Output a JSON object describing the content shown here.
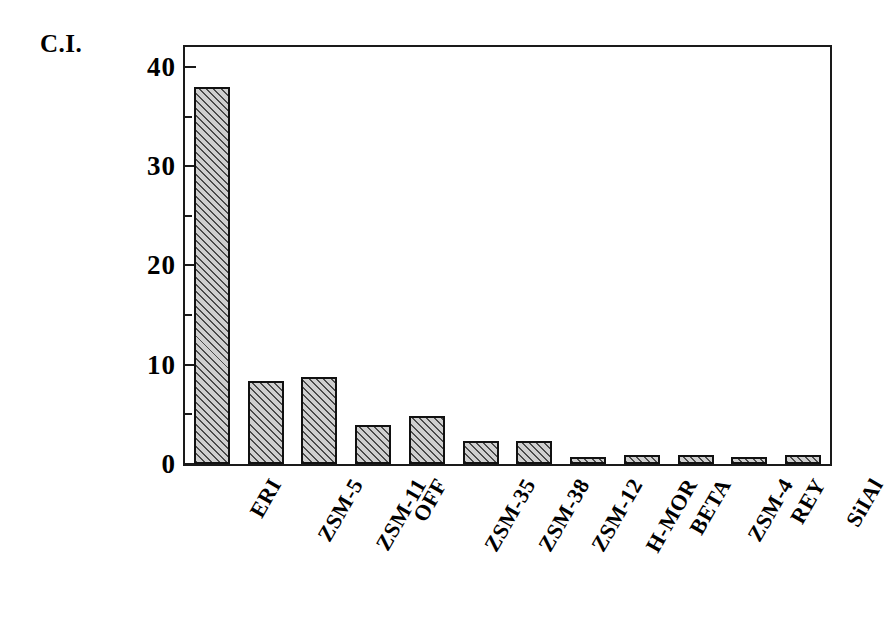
{
  "chart_data": {
    "type": "bar",
    "title": "",
    "subtitle": "",
    "xlabel": "",
    "ylabel": "C.I.",
    "ylim": [
      0,
      42
    ],
    "yticks": [
      0,
      10,
      20,
      30,
      40
    ],
    "ytick_labels": [
      "0",
      "10",
      "20",
      "30",
      "40"
    ],
    "yminor_ticks": [
      5,
      15,
      25,
      35
    ],
    "grid": false,
    "legend": null,
    "categories": [
      "ERI",
      "ZSM-5",
      "ZSM-11",
      "OFF",
      "ZSM-35",
      "ZSM-38",
      "ZSM-12",
      "H-MOR",
      "BETA",
      "ZSM-4",
      "REY",
      "SiIAl"
    ],
    "values": [
      38.0,
      8.4,
      8.8,
      3.9,
      4.8,
      2.3,
      2.3,
      0.7,
      0.9,
      0.9,
      0.7,
      0.9
    ],
    "series": [
      {
        "name": "C.I.",
        "values": [
          38.0,
          8.4,
          8.8,
          3.9,
          4.8,
          2.3,
          2.3,
          0.7,
          0.9,
          0.9,
          0.7,
          0.9
        ]
      }
    ],
    "bar_style": {
      "fill": "#cfcfcf",
      "hatch": "diagonal-45",
      "edge_color": "#111111"
    }
  },
  "axis": {
    "y_title": "C.I.",
    "frame_color": "#1a1a1a"
  }
}
